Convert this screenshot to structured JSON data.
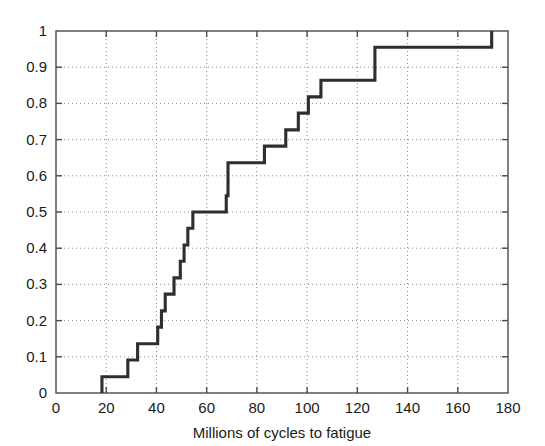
{
  "figure": {
    "background_color": "#ffffff",
    "line_color": "#2e2e2e",
    "grid_color": "#8c8c8c",
    "axis_color": "#4a4a4a"
  },
  "chart_data": {
    "type": "line",
    "subtype": "empirical-cdf-step",
    "title": "",
    "subtitle": "",
    "xlabel": "Millions of cycles to fatigue",
    "ylabel": "",
    "xlim": [
      0,
      180
    ],
    "ylim": [
      0,
      1
    ],
    "xticks": [
      0,
      20,
      40,
      60,
      80,
      100,
      120,
      140,
      160,
      180
    ],
    "xticklabels": [
      "0",
      "20",
      "40",
      "60",
      "80",
      "100",
      "120",
      "140",
      "160",
      "180"
    ],
    "yticks": [
      0,
      0.1,
      0.2,
      0.3,
      0.4,
      0.5,
      0.6,
      0.7,
      0.8,
      0.9,
      1
    ],
    "yticklabels": [
      "0",
      "0.1",
      "0.2",
      "0.3",
      "0.4",
      "0.5",
      "0.6",
      "0.7",
      "0.8",
      "0.9",
      "1"
    ],
    "grid": true,
    "grid_style": "dotted",
    "legend": null,
    "legend_position": "none",
    "sample_size": 22,
    "x": [
      18.3,
      28.6,
      32.5,
      40.5,
      42.0,
      43.5,
      47.0,
      49.5,
      51.0,
      52.5,
      54.5,
      67.8,
      68.5,
      83.0,
      91.5,
      96.5,
      100.5,
      105.5,
      107.0,
      127.0,
      173.5
    ],
    "y": [
      0.045,
      0.091,
      0.136,
      0.182,
      0.227,
      0.273,
      0.318,
      0.364,
      0.409,
      0.455,
      0.5,
      0.545,
      0.636,
      0.682,
      0.727,
      0.773,
      0.818,
      0.864,
      0.864,
      0.955,
      1.0
    ],
    "steps": [
      {
        "x": 18.3,
        "y": 0.045
      },
      {
        "x": 28.6,
        "y": 0.091
      },
      {
        "x": 32.5,
        "y": 0.136
      },
      {
        "x": 40.5,
        "y": 0.182
      },
      {
        "x": 42.0,
        "y": 0.227
      },
      {
        "x": 43.5,
        "y": 0.273
      },
      {
        "x": 47.0,
        "y": 0.318
      },
      {
        "x": 49.5,
        "y": 0.364
      },
      {
        "x": 51.0,
        "y": 0.409
      },
      {
        "x": 52.5,
        "y": 0.455
      },
      {
        "x": 54.5,
        "y": 0.5
      },
      {
        "x": 67.8,
        "y": 0.545
      },
      {
        "x": 68.5,
        "y": 0.636
      },
      {
        "x": 83.0,
        "y": 0.682
      },
      {
        "x": 91.5,
        "y": 0.727
      },
      {
        "x": 96.5,
        "y": 0.773
      },
      {
        "x": 100.5,
        "y": 0.818
      },
      {
        "x": 105.5,
        "y": 0.864
      },
      {
        "x": 127.0,
        "y": 0.955
      },
      {
        "x": 173.5,
        "y": 1.0
      }
    ],
    "start_point": {
      "x": 18.3,
      "y": 0.0
    },
    "end_point": {
      "x": 173.5,
      "y": 1.0
    }
  }
}
